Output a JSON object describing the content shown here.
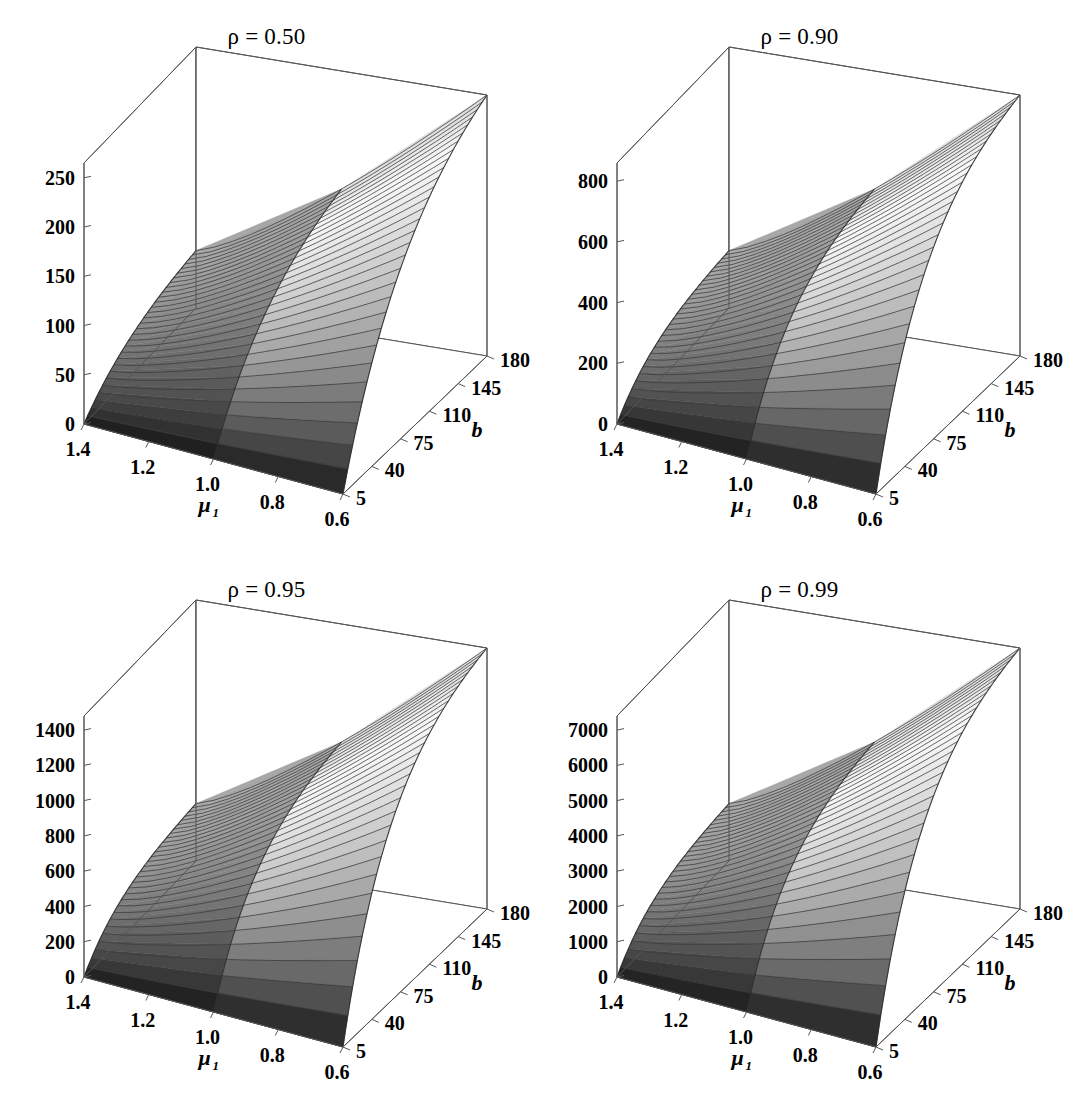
{
  "figure": {
    "layout": "2x2 grid of 3D surface plots",
    "background_color": "#ffffff",
    "text_color": "#000000",
    "panel_count": 4
  },
  "axes_common": {
    "x_axis_label": "μ",
    "x_axis_subscript": "1",
    "x_tick_labels": [
      "1.4",
      "1.2",
      "1.0",
      "0.8",
      "0.6"
    ],
    "x_values": [
      1.4,
      1.2,
      1.0,
      0.8,
      0.6
    ],
    "y_axis_label": "b",
    "y_tick_labels": [
      "5",
      "40",
      "75",
      "110",
      "145",
      "180"
    ],
    "y_values": [
      5,
      40,
      75,
      110,
      145,
      180
    ],
    "z_axis_label": ""
  },
  "chart_data": [
    {
      "type": "surface",
      "panel_index": 0,
      "title": "ρ = 0.50",
      "rho": 0.5,
      "xlabel": "μ₁",
      "ylabel": "b",
      "zlabel": "",
      "x": [
        1.4,
        1.2,
        1.0,
        0.8,
        0.6
      ],
      "y": [
        5,
        40,
        75,
        110,
        145,
        180
      ],
      "zlim": [
        0,
        265
      ],
      "z_ticks": [
        0,
        50,
        100,
        150,
        200,
        250
      ],
      "z_tick_labels": [
        "0",
        "50",
        "100",
        "150",
        "200",
        "250"
      ],
      "grid": true,
      "legend": "none",
      "surface_note": "monotone increasing in b and in 1/mu1; near-planar ramp, colormap grayscale dark(low) to white(high)",
      "z_corners": {
        "mu_1.4_b_5": 2,
        "mu_0.6_b_5": 5,
        "mu_1.4_b_180": 95,
        "mu_0.6_b_180": 258
      }
    },
    {
      "type": "surface",
      "panel_index": 1,
      "title": "ρ = 0.90",
      "rho": 0.9,
      "xlabel": "μ₁",
      "ylabel": "b",
      "zlabel": "",
      "x": [
        1.4,
        1.2,
        1.0,
        0.8,
        0.6
      ],
      "y": [
        5,
        40,
        75,
        110,
        145,
        180
      ],
      "zlim": [
        0,
        860
      ],
      "z_ticks": [
        0,
        200,
        400,
        600,
        800
      ],
      "z_tick_labels": [
        "0",
        "200",
        "400",
        "600",
        "800"
      ],
      "grid": true,
      "legend": "none",
      "surface_note": "monotone increasing in b and in 1/mu1; slight saturation at large b",
      "z_corners": {
        "mu_1.4_b_5": 5,
        "mu_0.6_b_5": 15,
        "mu_1.4_b_180": 300,
        "mu_0.6_b_180": 850
      }
    },
    {
      "type": "surface",
      "panel_index": 2,
      "title": "ρ = 0.95",
      "rho": 0.95,
      "xlabel": "μ₁",
      "ylabel": "b",
      "zlabel": "",
      "x": [
        1.4,
        1.2,
        1.0,
        0.8,
        0.6
      ],
      "y": [
        5,
        40,
        75,
        110,
        145,
        180
      ],
      "zlim": [
        0,
        1480
      ],
      "z_ticks": [
        0,
        200,
        400,
        600,
        800,
        1000,
        1200,
        1400
      ],
      "z_tick_labels": [
        "0",
        "200",
        "400",
        "600",
        "800",
        "1000",
        "1200",
        "1400"
      ],
      "grid": true,
      "legend": "none",
      "surface_note": "monotone increasing in b and in 1/mu1; saturation at large b",
      "z_corners": {
        "mu_1.4_b_5": 8,
        "mu_0.6_b_5": 25,
        "mu_1.4_b_180": 520,
        "mu_0.6_b_180": 1460
      }
    },
    {
      "type": "surface",
      "panel_index": 3,
      "title": "ρ = 0.99",
      "rho": 0.99,
      "xlabel": "μ₁",
      "ylabel": "b",
      "zlabel": "",
      "x": [
        1.4,
        1.2,
        1.0,
        0.8,
        0.6
      ],
      "y": [
        5,
        40,
        75,
        110,
        145,
        180
      ],
      "zlim": [
        0,
        7400
      ],
      "z_ticks": [
        0,
        1000,
        2000,
        3000,
        4000,
        5000,
        6000,
        7000
      ],
      "z_tick_labels": [
        "0",
        "1000",
        "2000",
        "3000",
        "4000",
        "5000",
        "6000",
        "7000"
      ],
      "grid": true,
      "legend": "none",
      "surface_note": "monotone increasing in b and in 1/mu1; strongest saturation at large b",
      "z_corners": {
        "mu_1.4_b_5": 40,
        "mu_0.6_b_5": 120,
        "mu_1.4_b_180": 2600,
        "mu_0.6_b_180": 7300
      }
    }
  ]
}
